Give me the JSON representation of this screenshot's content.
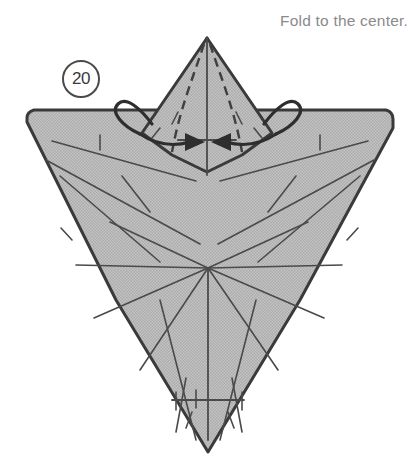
{
  "caption": {
    "text": "Fold to the center."
  },
  "step": {
    "number": "20"
  },
  "colors": {
    "paper_fill": "#bdbdbd",
    "outline": "#3a3a3a",
    "crease": "#4a4a4a",
    "dashed_fold": "#3f3f3f",
    "arrow": "#2e2e2e",
    "caption_text": "#8a8a8a",
    "background": "#ffffff"
  },
  "diagram": {
    "body_outline": "M27,122 L27,118 Q27,112 34,110 L178,110 L207,38 L236,110 L386,110 Q393,112 393,119 L393,128 L300,300 L208,452 L116,300 Z",
    "flap_outline": "M207,38 L272,133 L242,155 L207,172 L172,155 L142,133 Z",
    "center_line_top": {
      "x": 207,
      "y1": 38,
      "y2": 175
    },
    "center_crossbar_top": {
      "y": 140,
      "x1": 178,
      "x2": 236
    },
    "center_line_bottom": {
      "x": 208,
      "y1": 270,
      "y2": 440
    },
    "center_crossbar_bottom": {
      "y": 400,
      "x1": 172,
      "x2": 244
    },
    "hub": {
      "x": 208,
      "y": 268
    },
    "dashed_folds": [
      "M204,44 C193,78 180,108 172,152",
      "M210,44 C221,78 234,108 242,152"
    ],
    "arrows": {
      "left": {
        "loop": "M152,124 C140,108 126,96 118,104 C110,112 122,126 140,134",
        "shaft": "M140,134 C158,146 176,146 190,142",
        "head": "185,133 205,142 185,151"
      },
      "right": {
        "loop": "M264,124 C276,108 290,96 298,104 C306,112 294,126 276,134",
        "shaft": "M276,134 C258,146 240,146 226,142",
        "head": "231,133 211,142 231,151"
      }
    },
    "creases": [
      "M52,141 L196,181",
      "M46,160 L200,244",
      "M60,176 L160,262",
      "M110,222 L208,268",
      "M76,265 L208,268",
      "M94,318 L208,268",
      "M140,370 L208,268",
      "M368,141 L220,181",
      "M374,160 L218,244",
      "M360,176 L258,262",
      "M308,222 L208,268",
      "M342,265 L208,268",
      "M324,318 L208,268",
      "M278,370 L208,268",
      "M160,300 L196,440",
      "M256,300 L220,440",
      "M186,378 L176,432",
      "M232,378 L242,432"
    ],
    "tick_marks": [
      "M100,135 L100,150",
      "M320,135 L320,150",
      "M61,228 L72,240",
      "M358,228 L347,240",
      "M122,176 L150,212",
      "M296,176 L268,212",
      "M176,392 L176,410",
      "M242,392 L242,410",
      "M192,412 L186,428",
      "M228,412 L234,428",
      "M168,120 L176,132",
      "M248,120 L240,132",
      "M190,118 L186,130",
      "M226,118 L230,130",
      "M196,390 L196,408"
    ],
    "flap_short_dashes": [
      "M178,112 L172,124",
      "M236,112 L242,124",
      "M160,128 L152,138",
      "M254,128 L262,138"
    ]
  }
}
